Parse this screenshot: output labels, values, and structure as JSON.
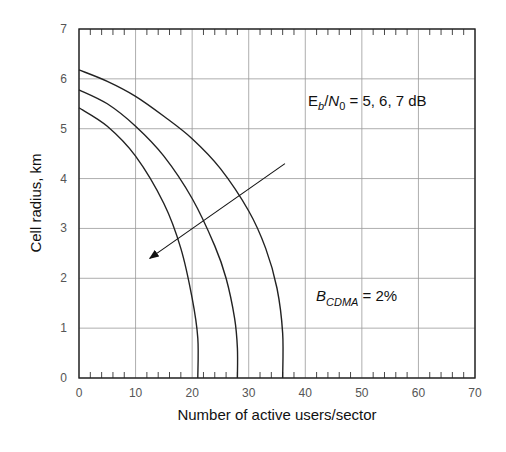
{
  "chart_data": {
    "type": "line",
    "title": "",
    "xlabel": "Number of active users/sector",
    "ylabel": "Cell radius, km",
    "xlim": [
      0,
      70
    ],
    "ylim": [
      0,
      7
    ],
    "xticks": [
      0,
      10,
      20,
      30,
      40,
      50,
      60,
      70
    ],
    "yticks": [
      0,
      1,
      2,
      3,
      4,
      5,
      6,
      7
    ],
    "grid": true,
    "legend": null,
    "series": [
      {
        "name": "Eb/N0 = 7 dB",
        "x": [
          0,
          5,
          10,
          15,
          18,
          20,
          21,
          21
        ],
        "y": [
          5.42,
          5.05,
          4.45,
          3.5,
          2.6,
          1.6,
          0.8,
          0
        ]
      },
      {
        "name": "Eb/N0 = 6 dB",
        "x": [
          0,
          5,
          10,
          15,
          20,
          24,
          26,
          27.5,
          28,
          28
        ],
        "y": [
          5.78,
          5.5,
          5.05,
          4.45,
          3.6,
          2.65,
          2.0,
          1.2,
          0.6,
          0
        ]
      },
      {
        "name": "Eb/N0 = 5 dB",
        "x": [
          0,
          5,
          10,
          15,
          20,
          25,
          30,
          33,
          35,
          36,
          36
        ],
        "y": [
          6.18,
          5.95,
          5.65,
          5.25,
          4.8,
          4.2,
          3.35,
          2.6,
          1.8,
          0.9,
          0
        ]
      }
    ],
    "annotations": [
      {
        "text": "Eb/N0 = 5, 6, 7 dB",
        "x": 40,
        "y": 5.6,
        "arrow_from": [
          36.4,
          4.3
        ],
        "arrow_to": [
          12.5,
          2.4
        ]
      },
      {
        "text": "BCDMA = 2%",
        "x": 42,
        "y": 1.5
      }
    ]
  },
  "labels": {
    "ylabel": "Cell radius, km",
    "xlabel": "Number of active users/sector",
    "ann1_E": "E",
    "ann1_b": "b",
    "ann1_slash": "/",
    "ann1_N": "N",
    "ann1_0": "0",
    "ann1_rest": " = 5, 6, 7 dB",
    "ann2_B": "B",
    "ann2_sub": "CDMA",
    "ann2_rest": " = 2%"
  },
  "ticks": {
    "x": [
      "0",
      "10",
      "20",
      "30",
      "40",
      "50",
      "60",
      "70"
    ],
    "y": [
      "0",
      "1",
      "2",
      "3",
      "4",
      "5",
      "6",
      "7"
    ]
  }
}
